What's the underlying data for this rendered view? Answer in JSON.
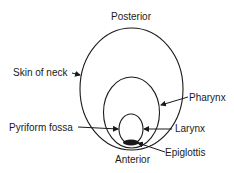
{
  "diagram": {
    "labels": {
      "top": "Posterior",
      "bottom": "Anterior",
      "skin": "Skin of neck",
      "pharynx": "Pharynx",
      "pyriform": "Pyriform fossa",
      "larynx": "Larynx",
      "epiglottis": "Epiglottis"
    },
    "stroke_color": "#1a1a1a"
  }
}
